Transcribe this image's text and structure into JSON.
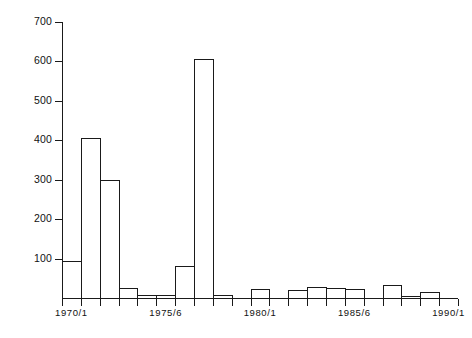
{
  "chart_data": {
    "type": "bar",
    "title": "",
    "subtitle": "",
    "xlabel": "",
    "ylabel": "",
    "ylim": [
      0,
      700
    ],
    "xlim": [
      1969.5,
      1991.5
    ],
    "grid": false,
    "legend": null,
    "y_ticks": [
      100,
      200,
      300,
      400,
      500,
      600,
      700
    ],
    "y_tick_labels": [
      "100",
      "200",
      "300",
      "400",
      "500",
      "600",
      "700"
    ],
    "x_tick_labels": [
      "1970/1",
      "1975/6",
      "1980/1",
      "1985/6",
      "1990/1"
    ],
    "x_tick_label_positions": [
      1970.5,
      1975.5,
      1980.5,
      1985.5,
      1990.5
    ],
    "categories": [
      "1970/1",
      "1971/2",
      "1972/3",
      "1973/4",
      "1974/5",
      "1975/6",
      "1976/7",
      "1977/8",
      "1978/9",
      "1979/80",
      "1980/1",
      "1981/2",
      "1982/3",
      "1983/4",
      "1984/5",
      "1985/6",
      "1986/7",
      "1987/8",
      "1988/9",
      "1989/90",
      "1990/1"
    ],
    "values": [
      95,
      405,
      300,
      25,
      8,
      8,
      80,
      605,
      8,
      0,
      22,
      0,
      20,
      28,
      25,
      22,
      0,
      32,
      5,
      15,
      0
    ],
    "bar_style": "outline",
    "bar_edge_color": "#1a1a1a",
    "bar_fill_color": "#ffffff"
  },
  "axes": {
    "y_axis_name": "y-axis",
    "x_axis_name": "x-axis",
    "n_x_ticks": 22
  }
}
